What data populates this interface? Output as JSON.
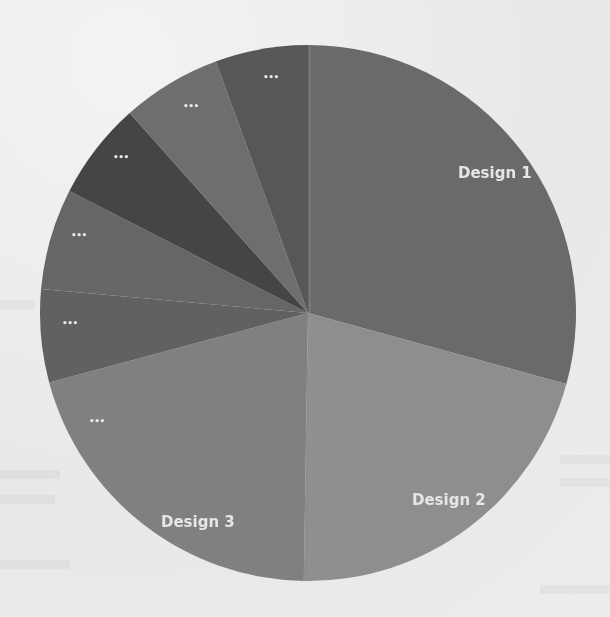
{
  "chart_data": {
    "type": "pie",
    "title": "",
    "start_angle_deg": 0,
    "direction": "clockwise",
    "center": [
      308,
      313
    ],
    "radius": 268,
    "legend": "none",
    "categories": [
      "Design 1",
      "Design 2",
      "Design 3",
      "...",
      "...",
      "...",
      "...",
      "..."
    ],
    "values": [
      29.3,
      21.0,
      20.6,
      5.6,
      6.1,
      5.9,
      6.0,
      5.6
    ],
    "unit": "percent (estimated from slice angles)",
    "colors": [
      "#6a6a6a",
      "#8e8e8e",
      "#808080",
      "#616161",
      "#666666",
      "#454545",
      "#6e6e6e",
      "#575757"
    ],
    "labels": [
      {
        "text": "Design 1",
        "x": 458,
        "y": 178,
        "kind": "big"
      },
      {
        "text": "Design 2",
        "x": 412,
        "y": 505,
        "kind": "big"
      },
      {
        "text": "Design 3",
        "x": 161,
        "y": 527,
        "kind": "big"
      },
      {
        "text": "...",
        "x": 89,
        "y": 424,
        "kind": "small"
      },
      {
        "text": "...",
        "x": 62,
        "y": 326,
        "kind": "small"
      },
      {
        "text": "...",
        "x": 71,
        "y": 238,
        "kind": "small"
      },
      {
        "text": "...",
        "x": 113,
        "y": 160,
        "kind": "small"
      },
      {
        "text": "...",
        "x": 183,
        "y": 109,
        "kind": "small"
      },
      {
        "text": "...",
        "x": 263,
        "y": 80,
        "kind": "small"
      }
    ]
  },
  "chart": {
    "label_design1": "Design 1",
    "label_design2": "Design 2",
    "label_design3": "Design 3",
    "label_other": "..."
  }
}
